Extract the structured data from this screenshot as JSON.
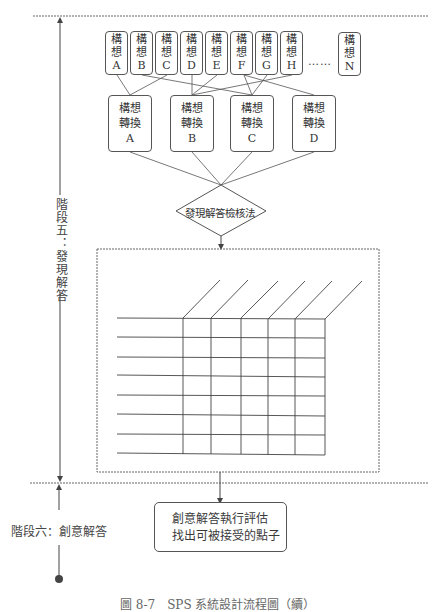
{
  "diagram": {
    "stage5": {
      "label": "階段五：發現解答",
      "ideas": [
        {
          "line1": "構",
          "line2": "想",
          "letter": "A"
        },
        {
          "line1": "構",
          "line2": "想",
          "letter": "B"
        },
        {
          "line1": "構",
          "line2": "想",
          "letter": "C"
        },
        {
          "line1": "構",
          "line2": "想",
          "letter": "D"
        },
        {
          "line1": "構",
          "line2": "想",
          "letter": "E"
        },
        {
          "line1": "構",
          "line2": "想",
          "letter": "F"
        },
        {
          "line1": "構",
          "line2": "想",
          "letter": "G"
        },
        {
          "line1": "構",
          "line2": "想",
          "letter": "H"
        },
        {
          "line1": "構",
          "line2": "想",
          "letter": "N"
        }
      ],
      "ellipsis": "……",
      "conversions": [
        {
          "line1": "構想",
          "line2": "轉換",
          "letter": "A"
        },
        {
          "line1": "構想",
          "line2": "轉換",
          "letter": "B"
        },
        {
          "line1": "構想",
          "line2": "轉換",
          "letter": "C"
        },
        {
          "line1": "構想",
          "line2": "轉換",
          "letter": "D"
        }
      ],
      "decision": "發現解答檢核法",
      "matrix": {
        "rows": 8,
        "columns": 5
      }
    },
    "stage6": {
      "label": "階段六：創意解答",
      "box_line1": "創意解答執行評估",
      "box_line2": "找出可被接受的點子"
    },
    "caption": "圖 8-7　SPS 系統設計流程圖（續）"
  }
}
